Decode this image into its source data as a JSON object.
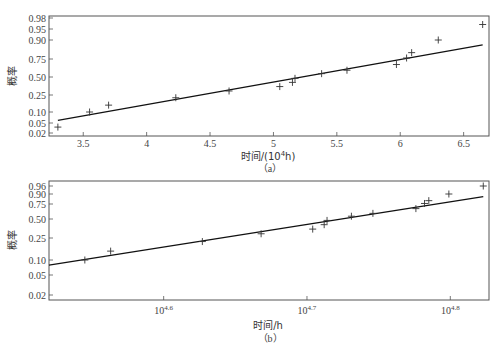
{
  "chart_data": [
    {
      "id": "a",
      "type": "scatter",
      "title": "",
      "caption": "（a）",
      "xlabel": "时间/(10⁴h)",
      "xlabel_main": "时间/(10",
      "xlabel_sup": "4",
      "xlabel_tail": "h)",
      "ylabel": "概率",
      "xscale": "linear",
      "yscale": "normal-probability",
      "xlim": [
        3.23,
        6.7
      ],
      "ylim": [
        0.015,
        0.985
      ],
      "xticks": [
        3.5,
        4,
        4.5,
        5,
        5.5,
        6,
        6.5
      ],
      "xtick_labels": [
        "3.5",
        "4",
        "4.5",
        "5",
        "5.5",
        "6",
        "6.5"
      ],
      "yticks": [
        0.02,
        0.05,
        0.1,
        0.25,
        0.5,
        0.75,
        0.9,
        0.95,
        0.98
      ],
      "ytick_labels": [
        "0.02",
        "0.05",
        "0.10",
        "0.25",
        "0.50",
        "0.75",
        "0.90",
        "0.95",
        "0.98"
      ],
      "ytick_px": [
        133,
        123,
        112,
        95,
        77,
        59,
        40,
        29,
        18
      ],
      "grid": false,
      "legend": null,
      "series": [
        {
          "name": "data",
          "marker": "+",
          "x": [
            3.3,
            3.55,
            3.7,
            4.23,
            4.65,
            5.05,
            5.15,
            5.17,
            5.38,
            5.58,
            5.97,
            6.05,
            6.09,
            6.3,
            6.65
          ],
          "y": [
            0.035,
            0.1,
            0.15,
            0.22,
            0.3,
            0.36,
            0.42,
            0.48,
            0.55,
            0.6,
            0.68,
            0.76,
            0.81,
            0.9,
            0.965
          ]
        },
        {
          "name": "fit",
          "type": "line",
          "x": [
            3.3,
            6.65
          ],
          "y": [
            0.06,
            0.87
          ]
        }
      ]
    },
    {
      "id": "b",
      "type": "scatter",
      "title": "",
      "caption": "（b）",
      "xlabel": "时间/h",
      "ylabel": "概率",
      "xscale": "log",
      "yscale": "normal-probability",
      "xlim_log10": [
        4.52,
        4.827
      ],
      "ylim": [
        0.015,
        0.97
      ],
      "xticks_log10": [
        4.6,
        4.7,
        4.8
      ],
      "xtick_labels": [
        "10^4.6",
        "10^4.7",
        "10^4.8"
      ],
      "xtick_base": "10",
      "xtick_exps": [
        "4.6",
        "4.7",
        "4.8"
      ],
      "yticks": [
        0.02,
        0.05,
        0.1,
        0.25,
        0.5,
        0.75,
        0.9,
        0.96
      ],
      "ytick_labels": [
        "0.02",
        "0.05",
        "0.10",
        "0.25",
        "0.50",
        "0.75",
        "0.90",
        "0.96"
      ],
      "ytick_px": [
        295,
        275,
        260,
        238,
        219,
        204,
        194,
        186
      ],
      "grid": false,
      "legend": null,
      "series": [
        {
          "name": "data",
          "marker": "+",
          "x_log10": [
            4.545,
            4.563,
            4.627,
            4.668,
            4.704,
            4.712,
            4.714,
            4.731,
            4.746,
            4.776,
            4.782,
            4.785,
            4.799,
            4.823
          ],
          "y": [
            0.1,
            0.15,
            0.22,
            0.3,
            0.36,
            0.42,
            0.48,
            0.55,
            0.6,
            0.68,
            0.76,
            0.81,
            0.9,
            0.96
          ]
        },
        {
          "name": "fit",
          "type": "line",
          "x_log10": [
            4.52,
            4.823
          ],
          "y": [
            0.08,
            0.87
          ]
        }
      ]
    }
  ]
}
